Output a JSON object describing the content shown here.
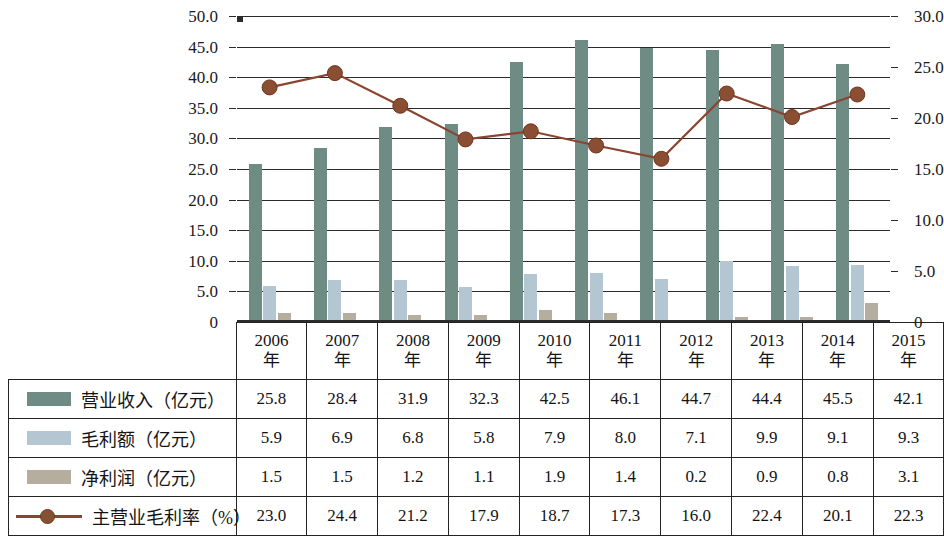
{
  "chart_data": {
    "type": "bar",
    "title": "",
    "xlabel": "",
    "categories": [
      "2006年",
      "2007年",
      "2008年",
      "2009年",
      "2010年",
      "2011年",
      "2012年",
      "2013年",
      "2014年",
      "2015年"
    ],
    "left_axis": {
      "label": "",
      "ylim": [
        0,
        50
      ],
      "ticks": [
        "0",
        "5.0",
        "10.0",
        "15.0",
        "20.0",
        "25.0",
        "30.0",
        "35.0",
        "40.0",
        "45.0",
        "50.0"
      ],
      "tick_values": [
        0,
        5,
        10,
        15,
        20,
        25,
        30,
        35,
        40,
        45,
        50
      ]
    },
    "right_axis": {
      "label": "",
      "ylim": [
        0,
        30
      ],
      "ticks": [
        "0",
        "5.0",
        "10.0",
        "15.0",
        "20.0",
        "25.0",
        "30.0"
      ],
      "tick_values": [
        0,
        5,
        10,
        15,
        20,
        25,
        30
      ],
      "minor_tick_values": [
        2.5,
        7.5,
        12.5,
        17.5,
        22.5,
        27.5
      ]
    },
    "grid": true,
    "legend_position": "table-below",
    "series": [
      {
        "name": "营业收入（亿元）",
        "type": "bar",
        "axis": "left",
        "color": "#6e8b84",
        "values": [
          25.8,
          28.4,
          31.9,
          32.3,
          42.5,
          46.1,
          44.7,
          44.4,
          45.5,
          42.1
        ]
      },
      {
        "name": "毛利额（亿元）",
        "type": "bar",
        "axis": "left",
        "color": "#b3c6d1",
        "values": [
          5.9,
          6.9,
          6.8,
          5.8,
          7.9,
          8.0,
          7.1,
          9.9,
          9.1,
          9.3
        ]
      },
      {
        "name": "净利润（亿元）",
        "type": "bar",
        "axis": "left",
        "color": "#b5ad9e",
        "values": [
          1.5,
          1.5,
          1.2,
          1.1,
          1.9,
          1.4,
          0.2,
          0.9,
          0.8,
          3.1
        ]
      },
      {
        "name": "主营业毛利率（%）",
        "type": "line",
        "axis": "right",
        "color": "#8a4430",
        "marker_color": "#8a4e33",
        "values": [
          23.0,
          24.4,
          21.2,
          17.9,
          18.7,
          17.3,
          16.0,
          22.4,
          20.1,
          22.3
        ]
      }
    ]
  },
  "table": {
    "header_blank": "",
    "year_headers": [
      "2006\n年",
      "2007\n年",
      "2008\n年",
      "2009\n年",
      "2010\n年",
      "2011\n年",
      "2012\n年",
      "2013\n年",
      "2014\n年",
      "2015\n年"
    ],
    "rows": [
      {
        "label": "营业收入（亿元）",
        "swatch": "revenue-swatch",
        "values": [
          "25.8",
          "28.4",
          "31.9",
          "32.3",
          "42.5",
          "46.1",
          "44.7",
          "44.4",
          "45.5",
          "42.1"
        ]
      },
      {
        "label": "毛利额（亿元）",
        "swatch": "gross-profit-swatch",
        "values": [
          "5.9",
          "6.9",
          "6.8",
          "5.8",
          "7.9",
          "8.0",
          "7.1",
          "9.9",
          "9.1",
          "9.3"
        ]
      },
      {
        "label": "净利润（亿元）",
        "swatch": "net-profit-swatch",
        "values": [
          "1.5",
          "1.5",
          "1.2",
          "1.1",
          "1.9",
          "1.4",
          "0.2",
          "0.9",
          "0.8",
          "3.1"
        ]
      },
      {
        "label": "主营业毛利率（%）",
        "swatch": "margin-line-swatch",
        "values": [
          "23.0",
          "24.4",
          "21.2",
          "17.9",
          "18.7",
          "17.3",
          "16.0",
          "22.4",
          "20.1",
          "22.3"
        ]
      }
    ]
  }
}
